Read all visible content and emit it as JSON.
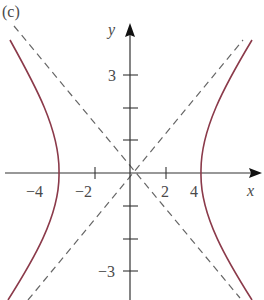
{
  "figure": {
    "panel_label": "(c)",
    "x_axis_label": "x",
    "y_axis_label": "y",
    "x_ticks": [
      {
        "value": -4,
        "label": "−4"
      },
      {
        "value": -2,
        "label": "−2"
      },
      {
        "value": 2,
        "label": "2"
      },
      {
        "value": 4,
        "label": "4"
      }
    ],
    "y_ticks": [
      {
        "value": 3,
        "label": "3"
      },
      {
        "value": 2,
        "label": ""
      },
      {
        "value": 1,
        "label": ""
      },
      {
        "value": -1,
        "label": ""
      },
      {
        "value": -2,
        "label": ""
      },
      {
        "value": -3,
        "label": "−3"
      }
    ],
    "curve_color": "#8b3a4a",
    "asymptote_color": "#555555",
    "axis_color": "#333333"
  }
}
